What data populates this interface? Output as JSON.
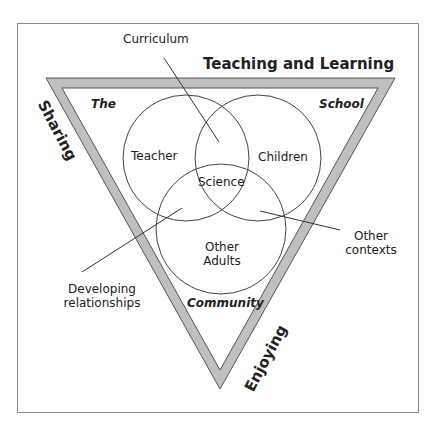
{
  "diagram": {
    "title": "Teaching and Learning",
    "triangle": {
      "fill_color": "#bfbfbf",
      "stroke_color": "#555555",
      "corner_labels": {
        "top_left": "The",
        "top_right": "School",
        "bottom": "Community"
      },
      "side_labels": {
        "top": "Teaching and Learning",
        "left": "Sharing",
        "right": "Enjoying"
      }
    },
    "circles": [
      {
        "label": "Teacher"
      },
      {
        "label": "Children"
      },
      {
        "label": "Other Adults",
        "line1": "Other",
        "line2": "Adults"
      }
    ],
    "center_label": "Science",
    "callouts": [
      {
        "label": "Curriculum"
      },
      {
        "label": "Developing relationships",
        "line1": "Developing",
        "line2": "relationships"
      },
      {
        "label": "Other contexts",
        "line1": "Other",
        "line2": "contexts"
      }
    ],
    "frame_color": "#888888"
  }
}
